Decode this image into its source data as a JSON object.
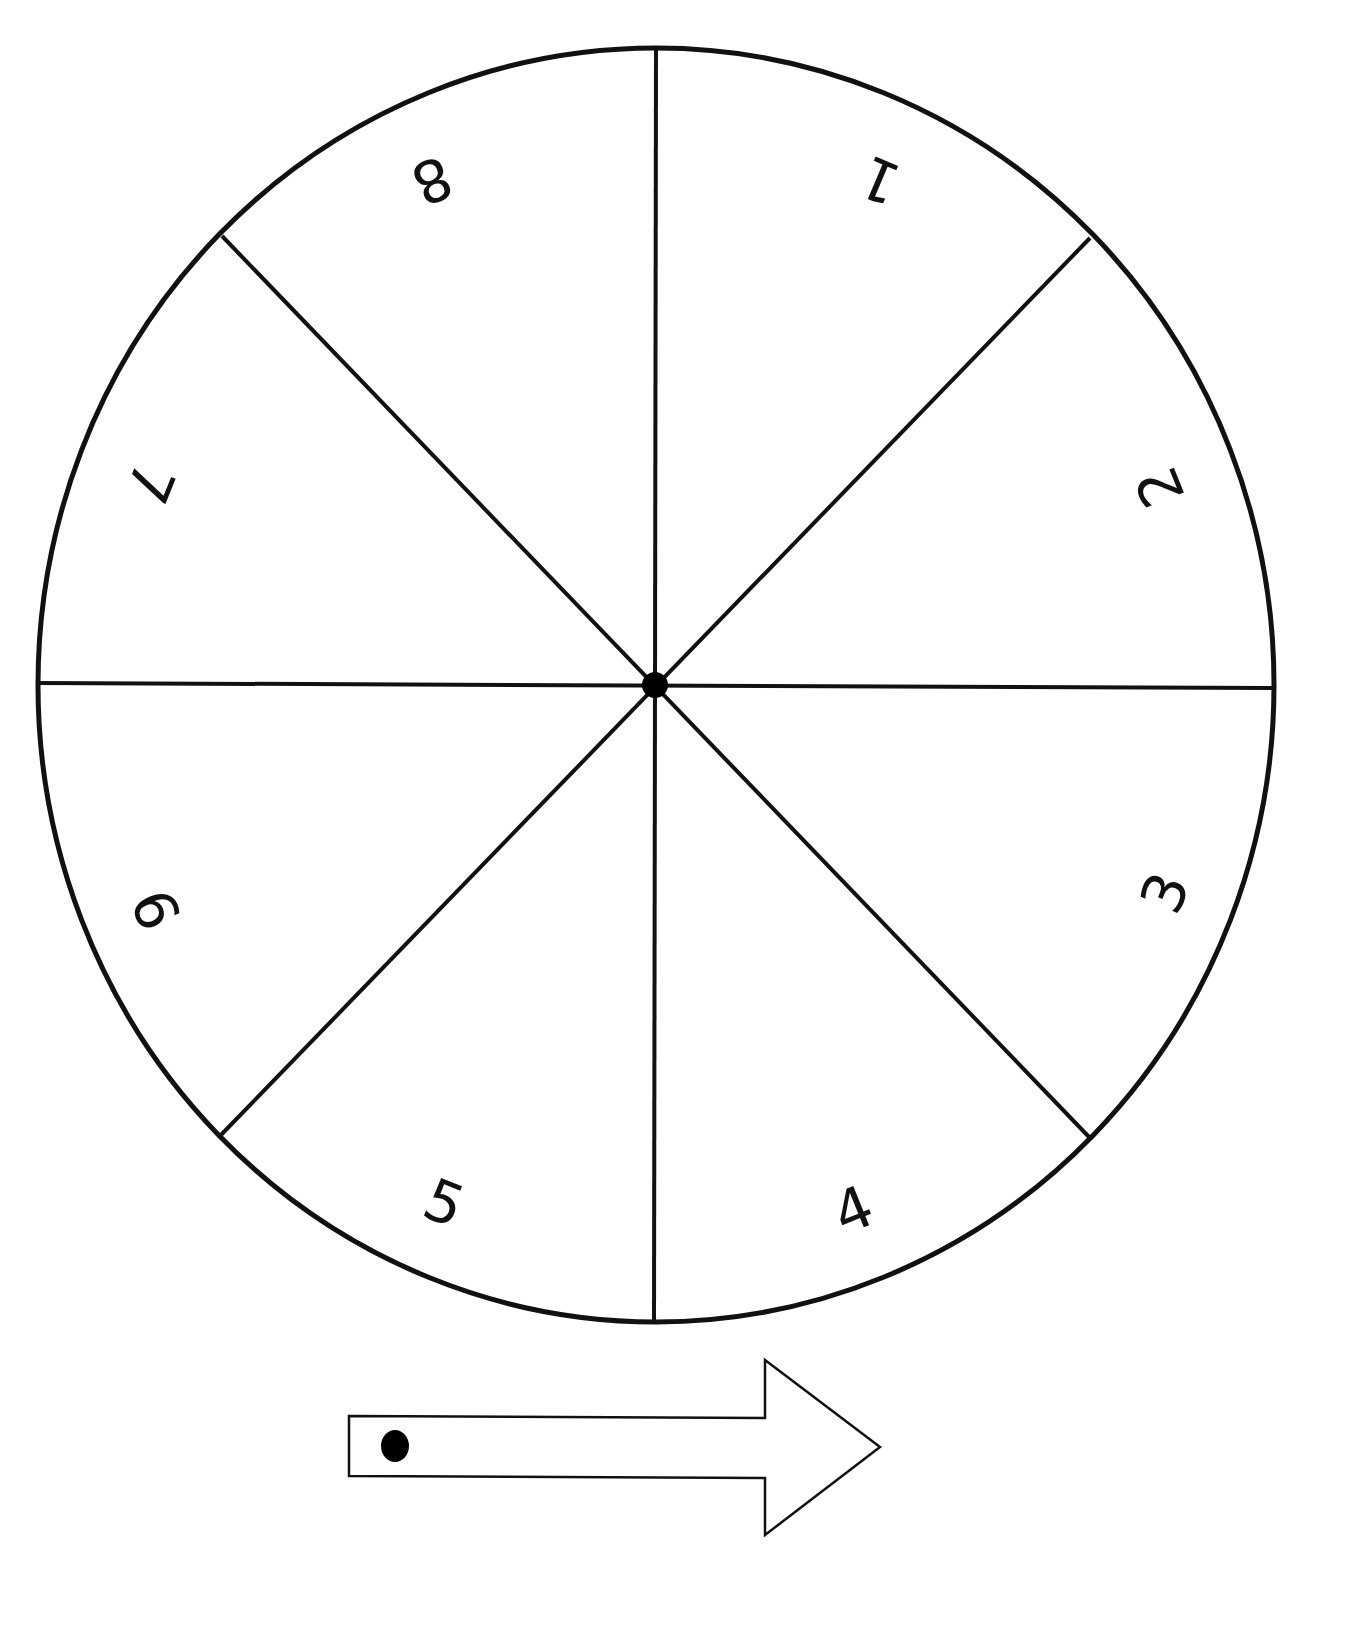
{
  "spinner": {
    "sections": 8,
    "labels": [
      "1",
      "2",
      "3",
      "4",
      "5",
      "6",
      "7",
      "8"
    ],
    "line_color": "#111111",
    "fill_color": "#ffffff"
  },
  "pointer": {
    "type": "arrow",
    "direction": "right"
  }
}
